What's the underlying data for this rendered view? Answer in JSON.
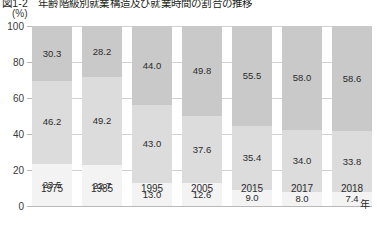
{
  "title": "図1-2　年齢階級別就業構造及び就業時間の割合の推移",
  "axis": {
    "y_unit": "(%)",
    "y_ticks": [
      "100",
      "80",
      "60",
      "40",
      "20",
      "0"
    ],
    "x_unit": "年"
  },
  "colors": {
    "segment_top": "#c9c9c9",
    "segment_middle": "#dcdcdc",
    "segment_bottom": "#f3f3f3",
    "gridline": "#d2d2d2",
    "text": "#2b2b2b"
  },
  "chart_data": {
    "type": "bar",
    "stacked": true,
    "stack_total": 100,
    "title": "図1-2　年齢階級別就業構造及び就業時間の割合の推移",
    "xlabel": "年",
    "ylabel": "(%)",
    "ylim": [
      0,
      100
    ],
    "yticks": [
      0,
      20,
      40,
      60,
      80,
      100
    ],
    "grid": true,
    "legend": "none",
    "categories": [
      "1975",
      "1985",
      "1995",
      "2005",
      "2015",
      "2017",
      "2018"
    ],
    "series": [
      {
        "name": "上段",
        "values": [
          30.3,
          28.2,
          44.0,
          49.8,
          55.5,
          58.0,
          58.6
        ]
      },
      {
        "name": "中段",
        "values": [
          46.2,
          49.2,
          43.0,
          37.6,
          35.4,
          34.0,
          33.8
        ]
      },
      {
        "name": "下段",
        "values": [
          23.5,
          22.7,
          13.0,
          12.6,
          9.0,
          8.0,
          7.4
        ]
      }
    ],
    "bars": [
      {
        "category": "1975",
        "top": "30.3",
        "middle": "46.2",
        "bottom": "23.5"
      },
      {
        "category": "1985",
        "top": "28.2",
        "middle": "49.2",
        "bottom": "22.7"
      },
      {
        "category": "1995",
        "top": "44.0",
        "middle": "43.0",
        "bottom": "13.0"
      },
      {
        "category": "2005",
        "top": "49.8",
        "middle": "37.6",
        "bottom": "12.6"
      },
      {
        "category": "2015",
        "top": "55.5",
        "middle": "35.4",
        "bottom": "9.0"
      },
      {
        "category": "2017",
        "top": "58.0",
        "middle": "34.0",
        "bottom": "8.0"
      },
      {
        "category": "2018",
        "top": "58.6",
        "middle": "33.8",
        "bottom": "7.4"
      }
    ]
  }
}
